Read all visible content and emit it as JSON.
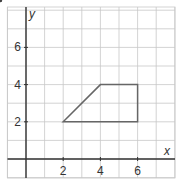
{
  "diagram": {
    "axes": {
      "x_label": "x",
      "y_label": "y",
      "x_range": [
        -1,
        8
      ],
      "y_range": [
        -1,
        8
      ]
    },
    "x_ticks": [
      {
        "value": 2,
        "label": "2"
      },
      {
        "value": 4,
        "label": "4"
      },
      {
        "value": 6,
        "label": "6"
      }
    ],
    "y_ticks": [
      {
        "value": 2,
        "label": "2"
      },
      {
        "value": 4,
        "label": "4"
      },
      {
        "value": 6,
        "label": "6"
      }
    ],
    "line": {
      "equation": "y = x",
      "marked_point": [
        6,
        6
      ]
    },
    "original_rectangle": {
      "vertices": [
        "A",
        "B",
        "C",
        "D"
      ]
    },
    "reflected_rectangle": {
      "vertices": [
        "A",
        "B",
        "C'",
        "D'"
      ]
    },
    "points": [
      {
        "name": "A",
        "label": "A",
        "x": 2,
        "y": 2
      },
      {
        "name": "B",
        "label": "B",
        "x": 4,
        "y": 4
      },
      {
        "name": "C",
        "label": "C",
        "x": 6,
        "y": 4
      },
      {
        "name": "D",
        "label": "D",
        "x": 6,
        "y": 2
      },
      {
        "name": "C-prime",
        "label": "C′",
        "x": 4,
        "y": 6
      },
      {
        "name": "D-prime",
        "label": "D′",
        "x": 2,
        "y": 6
      }
    ]
  }
}
